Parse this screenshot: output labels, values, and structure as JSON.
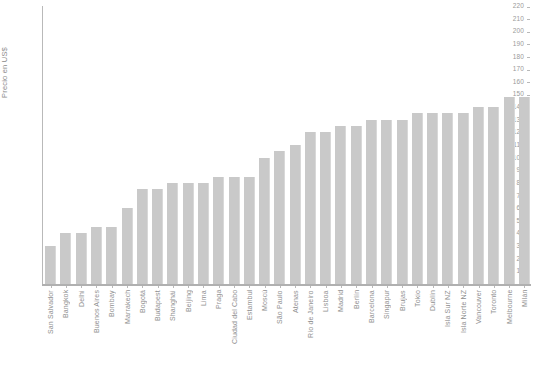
{
  "chart_data": {
    "type": "bar",
    "title": "",
    "xlabel": "",
    "ylabel": "Precio en US$",
    "ylim": [
      0,
      220
    ],
    "ytick_step": 10,
    "grid": false,
    "legend": false,
    "bar_color": "#c9c9c9",
    "axis_color": "#b9b9b9",
    "text_color": "#8f8f8f",
    "yticks": [
      0,
      10,
      20,
      30,
      40,
      50,
      60,
      70,
      80,
      90,
      100,
      110,
      120,
      130,
      140,
      150,
      160,
      170,
      180,
      190,
      200,
      210,
      220
    ],
    "ytick_labels": [
      "0",
      "10",
      "20",
      "30",
      "40",
      "50",
      "60",
      "70",
      "80",
      "90",
      "100",
      "110",
      "120",
      "130",
      "140",
      "150",
      "160",
      "170",
      "180",
      "190",
      "200",
      "210",
      "220"
    ],
    "categories": [
      "San Salvador",
      "Bangkok",
      "Delhi",
      "Buenos Aires",
      "Bombay",
      "Marrakech",
      "Bogotá",
      "Budapest",
      "Shanghái",
      "Beijing",
      "Lima",
      "Praga",
      "Ciudad del Cabo",
      "Estambul",
      "Moscú",
      "São Paulo",
      "Atenas",
      "Río de Janeiro",
      "Lisboa",
      "Madrid",
      "Berlín",
      "Barcelona",
      "Singapur",
      "Brujas",
      "Tokio",
      "Dublín",
      "Isla Sur NZ",
      "Isla Norte NZ",
      "Vancouver",
      "Toronto",
      "Melbourne",
      "Milán"
    ],
    "values": [
      30,
      40,
      40,
      45,
      45,
      60,
      75,
      75,
      80,
      80,
      80,
      85,
      85,
      85,
      100,
      105,
      110,
      120,
      120,
      125,
      125,
      130,
      130,
      130,
      135,
      135,
      135,
      135,
      140,
      140,
      148,
      148
    ]
  }
}
